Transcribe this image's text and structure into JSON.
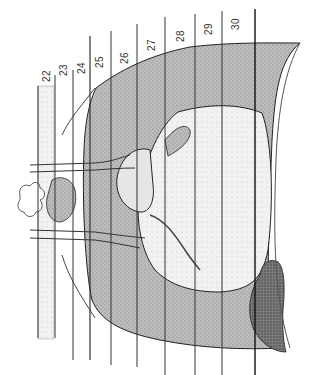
{
  "figure": {
    "type": "anatomical-illustration",
    "colors": {
      "line": "#222222",
      "stipple_dark": "#6e6e6e",
      "stipple_mid": "#a8a8a8",
      "stipple_light": "#d4d4d4",
      "background": "#ffffff"
    }
  },
  "level_lines": [
    {
      "label": "22",
      "x": 44,
      "top": 86,
      "bottom": 338,
      "shaded_band": true
    },
    {
      "label": "23",
      "x": 55,
      "top": 75,
      "bottom": 338
    },
    {
      "label": "24",
      "x": 73,
      "top": 70,
      "bottom": 360
    },
    {
      "label": "25",
      "x": 90,
      "top": 36,
      "bottom": 360
    },
    {
      "label": "26",
      "x": 111,
      "top": 31,
      "bottom": 365
    },
    {
      "label": "27",
      "x": 137,
      "top": 24,
      "bottom": 367
    },
    {
      "label": "28",
      "x": 165,
      "top": 17,
      "bottom": 375
    },
    {
      "label": "29",
      "x": 195,
      "top": 14,
      "bottom": 375
    },
    {
      "label": "30",
      "x": 222,
      "top": 11,
      "bottom": 375
    },
    {
      "label": "",
      "x": 255,
      "top": 9,
      "bottom": 375
    }
  ]
}
